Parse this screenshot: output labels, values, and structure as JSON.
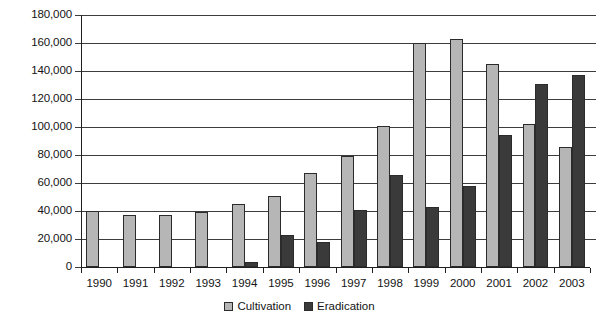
{
  "chart_data": {
    "type": "bar",
    "title": "",
    "subtitle": "",
    "xlabel": "",
    "ylabel": "",
    "categories": [
      "1990",
      "1991",
      "1992",
      "1993",
      "1994",
      "1995",
      "1996",
      "1997",
      "1998",
      "1999",
      "2000",
      "2001",
      "2002",
      "2003"
    ],
    "series": [
      {
        "name": "Cultivation",
        "color": "#b6b6b6",
        "values": [
          40000,
          37500,
          37000,
          39500,
          45000,
          51000,
          67000,
          79000,
          101000,
          160000,
          163000,
          145000,
          102000,
          86000
        ]
      },
      {
        "name": "Eradication",
        "color": "#3a3a3a",
        "values": [
          0,
          0,
          0,
          0,
          3500,
          23000,
          18000,
          41000,
          66000,
          43000,
          58000,
          94000,
          131000,
          137000
        ]
      }
    ],
    "ylim": [
      0,
      180000
    ],
    "ytick_values": [
      0,
      20000,
      40000,
      60000,
      80000,
      100000,
      120000,
      140000,
      160000,
      180000
    ],
    "ytick_labels": [
      "0",
      "20,000",
      "40,000",
      "60,000",
      "80,000",
      "100,000",
      "120,000",
      "140,000",
      "160,000",
      "180,000"
    ],
    "grid": true,
    "legend_position": "bottom"
  },
  "legend": {
    "items": [
      {
        "label": "Cultivation"
      },
      {
        "label": "Eradication"
      }
    ]
  }
}
